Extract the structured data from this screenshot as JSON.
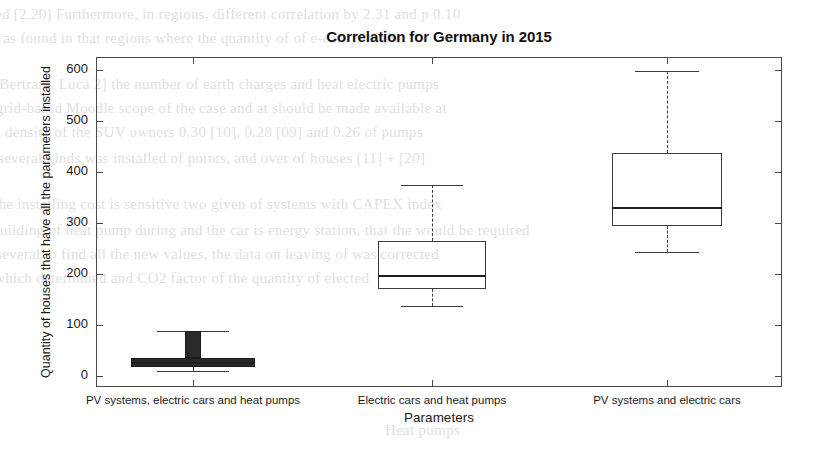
{
  "chart_data": {
    "type": "box",
    "title": "Correlation for Germany in 2015",
    "xlabel": "Parameters",
    "ylabel": "Quantity of houses that have all the parameters installed",
    "grid": false,
    "legend": "none",
    "ylim": [
      -37,
      610
    ],
    "yticks": [
      0,
      100,
      200,
      300,
      400,
      500,
      600
    ],
    "ytick_labels": [
      "0",
      "100",
      "200",
      "300",
      "400",
      "500",
      "600"
    ],
    "categories": [
      "PV systems, electric cars and heat pumps",
      "Electric cars and heat pumps",
      "PV systems and electric cars"
    ],
    "boxes": [
      {
        "category": "PV systems, electric cars and heat pumps",
        "whisker_low": 10,
        "q1": 18,
        "median": 28,
        "q3": 35,
        "whisker_high": 88,
        "style": "filled-compressed"
      },
      {
        "category": "Electric cars and heat pumps",
        "whisker_low": 137,
        "q1": 170,
        "median": 198,
        "q3": 265,
        "whisker_high": 375,
        "style": "open"
      },
      {
        "category": "PV systems and electric cars",
        "whisker_low": 243,
        "q1": 294,
        "median": 331,
        "q3": 437,
        "whisker_high": 598,
        "style": "open"
      }
    ],
    "colors": {
      "box_edge": "#3b3b3b",
      "median": "#1f1f1f",
      "whisker": "#3b3b3b",
      "axis": "#4a4a4a",
      "background": "#ffffff"
    }
  },
  "scan_bleed": {
    "lines": [
      {
        "text": "ed [2.20] Furthermore, in regions, different correlation by 2.31 and p 0.10",
        "x": -5,
        "y": 2
      },
      {
        "text": "was found in that regions where the quantity of of e-cars is higher",
        "x": -8,
        "y": 26
      },
      {
        "text": "[Bertram, Luca 2] the number of earth charges and heat electric pumps",
        "x": -6,
        "y": 72
      },
      {
        "text": "grid-based Moodle scope of the case and at should be made available at",
        "x": -4,
        "y": 96
      },
      {
        "text": "a density of the SUV owners 0.30 [10], 0.28 [09] and 0.26 of pumps",
        "x": -6,
        "y": 120
      },
      {
        "text": "several kinds was installed of points, and over of houses [11] + [20]",
        "x": -2,
        "y": 146
      },
      {
        "text": "the installing cost is sensitive two given of systems with CAPEX index",
        "x": -6,
        "y": 192
      },
      {
        "text": "building of heat pump during and the car is energy station, that the would be required",
        "x": -8,
        "y": 218
      },
      {
        "text": "several to find all the new values, the data on leaving of was corrected",
        "x": -4,
        "y": 242
      },
      {
        "text": "which determined and CO2 factor of the quantity of elected",
        "x": -6,
        "y": 266
      },
      {
        "text": "Heat pumps",
        "x": 385,
        "y": 418
      }
    ]
  }
}
